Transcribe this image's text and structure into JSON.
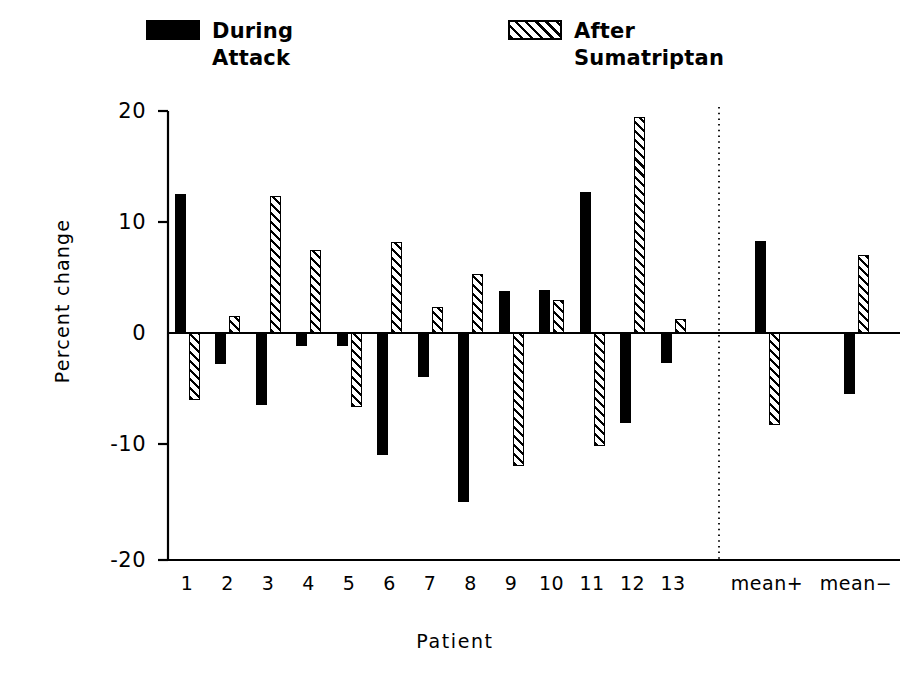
{
  "legend": {
    "during": {
      "line1": "During",
      "line2": "Attack",
      "swatch": "solid-black-swatch"
    },
    "after": {
      "line1": "After",
      "line2": "Sumatriptan",
      "swatch": "hatched-swatch"
    }
  },
  "chart_data": {
    "type": "bar",
    "title": "",
    "xlabel": "Patient",
    "ylabel": "Percent change",
    "ylim": [
      -20,
      20
    ],
    "yticks": [
      20,
      10,
      0,
      -10,
      -20
    ],
    "ytick_labels": [
      "20",
      "10",
      "0",
      "-10",
      "-20"
    ],
    "grid": false,
    "legend_position": "above-plot",
    "zero_line": true,
    "separator_before_category": "mean+",
    "categories": [
      "1",
      "2",
      "3",
      "4",
      "5",
      "6",
      "7",
      "8",
      "9",
      "10",
      "11",
      "12",
      "13",
      "mean+",
      "mean−"
    ],
    "series": [
      {
        "name": "During Attack",
        "fill": "solid-black",
        "values": [
          12.5,
          -2.8,
          -6.5,
          -1.2,
          -1.2,
          -11.0,
          -4.0,
          -15.2,
          3.8,
          3.9,
          12.7,
          -8.1,
          -2.7,
          8.3,
          -5.5
        ]
      },
      {
        "name": "After Sumatriptan",
        "fill": "hatched",
        "values": [
          -6.0,
          1.5,
          12.3,
          7.5,
          -6.7,
          8.2,
          2.3,
          5.3,
          -12.0,
          3.0,
          -10.2,
          19.5,
          1.3,
          -8.3,
          7.0
        ]
      }
    ]
  },
  "colors": {
    "ink": "#000000",
    "background": "#ffffff"
  }
}
